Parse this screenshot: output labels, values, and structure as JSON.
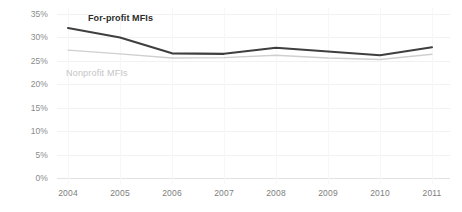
{
  "chart_data": {
    "type": "line",
    "title": "",
    "xlabel": "",
    "ylabel": "",
    "categories": [
      "2004",
      "2005",
      "2006",
      "2007",
      "2008",
      "2009",
      "2010",
      "2011"
    ],
    "x": [
      2004,
      2005,
      2006,
      2007,
      2008,
      2009,
      2010,
      2011
    ],
    "ylim": [
      0,
      35
    ],
    "yticks": [
      0,
      5,
      10,
      15,
      20,
      25,
      30,
      35
    ],
    "ytick_labels": [
      "0%",
      "5%",
      "10%",
      "15%",
      "20%",
      "25%",
      "30%",
      "35%"
    ],
    "ytick_suffix": "%",
    "grid": true,
    "legend": "inline-labels",
    "series": [
      {
        "name": "For-profit MFIs",
        "color": "#3f3f3f",
        "line_width": 2.1,
        "values": [
          32.0,
          30.0,
          26.6,
          26.5,
          27.8,
          27.0,
          26.2,
          27.9
        ],
        "label_position": "above-line-left"
      },
      {
        "name": "Nonprofit MFIs",
        "color": "#cfcfcf",
        "line_width": 1.4,
        "values": [
          27.3,
          26.5,
          25.6,
          25.7,
          26.2,
          25.6,
          25.3,
          26.4
        ],
        "label_position": "below-line-left"
      }
    ],
    "annotations": [
      {
        "text": "For-profit MFIs",
        "color": "#2b2b2b",
        "bold": true
      },
      {
        "text": "Nonprofit MFIs",
        "color": "#c4c4c4",
        "bold": false
      }
    ]
  },
  "axis": {
    "y_labels": [
      "35%",
      "30%",
      "25%",
      "20%",
      "15%",
      "10%",
      "5%",
      "0%"
    ],
    "x_labels": [
      "2004",
      "2005",
      "2006",
      "2007",
      "2008",
      "2009",
      "2010",
      "2011"
    ]
  },
  "labels": {
    "forprofit": "For-profit MFIs",
    "nonprofit": "Nonprofit MFIs"
  },
  "colors": {
    "forprofit_line": "#3f3f3f",
    "nonprofit_line": "#cfcfcf",
    "gridline": "#f1f1f1",
    "baseline": "#e2e2e2",
    "tick_text": "#8c8c8c",
    "background": "#ffffff"
  }
}
